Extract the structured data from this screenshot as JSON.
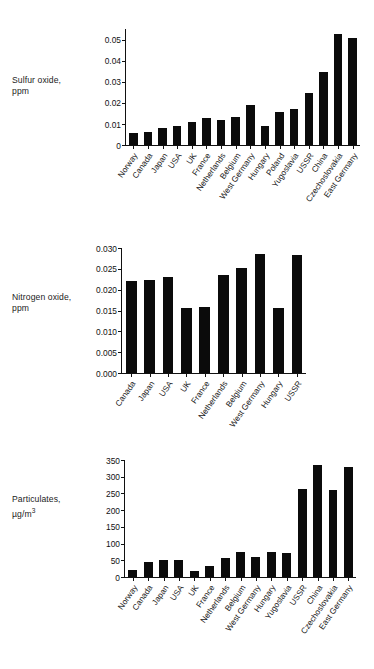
{
  "chart_data": [
    {
      "type": "bar",
      "title": "",
      "ylabel_line1": "Sulfur oxide,",
      "ylabel_line2": "ppm",
      "ylabel": "Sulfur oxide, ppm",
      "xlabel": "",
      "ylim": [
        0,
        0.055
      ],
      "yticks": [
        "0",
        "0.01",
        "0.02",
        "0.03",
        "0.04",
        "0.05"
      ],
      "ytick_values": [
        0,
        0.01,
        0.02,
        0.03,
        0.04,
        0.05
      ],
      "grid": false,
      "legend": "none",
      "categories": [
        "Norway",
        "Canada",
        "Japan",
        "USA",
        "UK",
        "France",
        "Netherlands",
        "Belgium",
        "West Germany",
        "Hungary",
        "Poland",
        "Yugoslavia",
        "USSR",
        "China",
        "Czechoslovakia",
        "East Germany"
      ],
      "values": [
        0.0055,
        0.0062,
        0.0082,
        0.0088,
        0.0111,
        0.0127,
        0.0118,
        0.0134,
        0.0192,
        0.0088,
        0.0156,
        0.0172,
        0.0246,
        0.0345,
        0.0525,
        0.0508
      ]
    },
    {
      "type": "bar",
      "title": "",
      "ylabel_line1": "Nitrogen oxide,",
      "ylabel_line2": "ppm",
      "ylabel": "Nitrogen oxide, ppm",
      "xlabel": "",
      "ylim": [
        0,
        0.03
      ],
      "yticks": [
        "0.000",
        "0.005",
        "0.010",
        "0.015",
        "0.020",
        "0.025",
        "0.030"
      ],
      "ytick_values": [
        0.0,
        0.005,
        0.01,
        0.015,
        0.02,
        0.025,
        0.03
      ],
      "grid": false,
      "legend": "none",
      "categories": [
        "Canada",
        "Japan",
        "USA",
        "UK",
        "France",
        "Netherlands",
        "Belgium",
        "West Germany",
        "Hungary",
        "USSR"
      ],
      "values": [
        0.022,
        0.0224,
        0.0231,
        0.0155,
        0.0159,
        0.0236,
        0.0252,
        0.0285,
        0.0155,
        0.0284
      ]
    },
    {
      "type": "bar",
      "title": "",
      "ylabel_line1": "Particulates,",
      "ylabel_line2": "µg/m³",
      "ylabel": "Particulates, µg/m3",
      "xlabel": "",
      "ylim": [
        0,
        350
      ],
      "yticks": [
        "0",
        "50",
        "100",
        "150",
        "200",
        "250",
        "300",
        "350"
      ],
      "ytick_values": [
        0,
        50,
        100,
        150,
        200,
        250,
        300,
        350
      ],
      "grid": false,
      "legend": "none",
      "categories": [
        "Norway",
        "Canada",
        "Japan",
        "USA",
        "UK",
        "France",
        "Netherlands",
        "Belgium",
        "West Germany",
        "Hungary",
        "Yugoslavia",
        "USSR",
        "China",
        "Czechoslovakia",
        "East Germany"
      ],
      "values": [
        22,
        45,
        50,
        52,
        19,
        33,
        56,
        76,
        61,
        74,
        73,
        264,
        336,
        259,
        330
      ]
    }
  ],
  "style": {
    "bar_color": "#0b0b0b",
    "axis_color": "#111111",
    "background": "#ffffff",
    "text_color": "#1a1a1a"
  }
}
